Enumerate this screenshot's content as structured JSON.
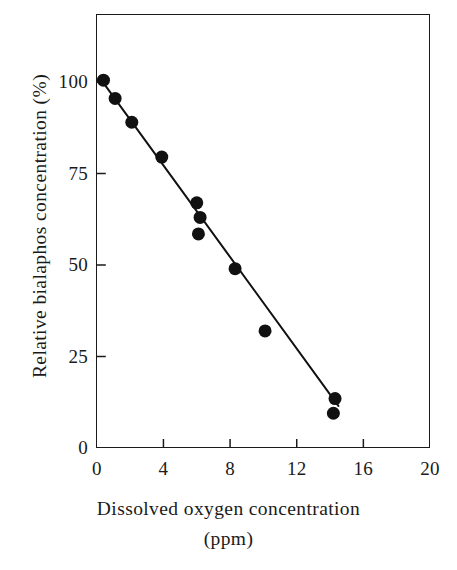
{
  "chart_data": {
    "type": "scatter",
    "title": "",
    "subtitle": "",
    "xlabel_line1": "Dissolved  oxygen  concentration",
    "xlabel_line2": "(ppm)",
    "ylabel": "Relative  bialaphos  concentration (%)",
    "xlim": [
      0,
      20
    ],
    "ylim": [
      0,
      110
    ],
    "xticks": [
      0,
      4,
      8,
      12,
      16,
      20
    ],
    "yticks": [
      0,
      25,
      50,
      75,
      100
    ],
    "xtick_labels": [
      "0",
      "4",
      "8",
      "12",
      "16",
      "20"
    ],
    "ytick_labels": [
      "0",
      "25",
      "50",
      "75",
      "100"
    ],
    "grid": false,
    "legend": false,
    "legend_position": "none",
    "marker": "filled-circle",
    "marker_color": "#111111",
    "marker_size_px": 13,
    "line_color": "#111111",
    "line_width_px": 2,
    "frame": true,
    "series": [
      {
        "name": "Relative bialaphos concentration",
        "points": [
          {
            "x": 0.4,
            "y": 100.5
          },
          {
            "x": 1.1,
            "y": 95.5
          },
          {
            "x": 2.1,
            "y": 89.0
          },
          {
            "x": 3.9,
            "y": 79.5
          },
          {
            "x": 6.0,
            "y": 67.0
          },
          {
            "x": 6.2,
            "y": 63.0
          },
          {
            "x": 6.1,
            "y": 58.5
          },
          {
            "x": 8.3,
            "y": 49.0
          },
          {
            "x": 10.1,
            "y": 32.0
          },
          {
            "x": 14.3,
            "y": 13.5
          },
          {
            "x": 14.2,
            "y": 9.5
          }
        ]
      }
    ],
    "fit_line": {
      "name": "linear regression",
      "x_start": 0.2,
      "y_start": 101.0,
      "x_end": 14.5,
      "y_end": 11.5
    }
  },
  "colors": {
    "background": "#ffffff",
    "foreground": "#111111",
    "axis": "#1a1a1a"
  }
}
